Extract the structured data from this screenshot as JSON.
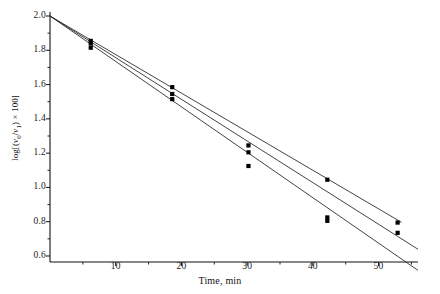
{
  "figure": {
    "background": "#ffffff",
    "ink": "#111111",
    "line_color": "#222222",
    "marker_color": "#000000"
  },
  "axes": {
    "x": {
      "label": "Time, min",
      "ticks": [
        10,
        20,
        30,
        40,
        50
      ],
      "tick_labels": [
        "10",
        "20",
        "30",
        "40",
        "50"
      ],
      "minor_ticks": [
        5,
        15,
        25,
        35,
        45,
        55
      ],
      "range": [
        0,
        56
      ]
    },
    "y": {
      "label_plain": "log[(v0/v1) × 100]",
      "label_parts": {
        "pre": "log[(",
        "v_num": "v",
        "sub_num": "0",
        "slash": "/",
        "v_den": "v",
        "sub_den": "1",
        "post": ") × 100]"
      },
      "ticks": [
        0.6,
        0.8,
        1.0,
        1.2,
        1.4,
        1.6,
        1.8,
        2.0
      ],
      "tick_labels": [
        "0.6",
        "0.8",
        "1.0",
        "1.2",
        "1.4",
        "1.6",
        "1.8",
        "2.0"
      ],
      "minor_ticks": [
        0.7,
        0.9,
        1.1,
        1.3,
        1.5,
        1.7,
        1.9
      ],
      "range": [
        0.52,
        2.05
      ]
    }
  },
  "chart_data": {
    "type": "scatter",
    "title": "",
    "subtitle": "",
    "xlabel": "Time, min",
    "ylabel": "log[(v0/v1) × 100]",
    "xlim": [
      0,
      56
    ],
    "ylim": [
      0.52,
      2.05
    ],
    "grid": false,
    "legend": false,
    "legend_position": "none",
    "marker": "filled-square",
    "annotations": [
      "All three fitted lines converge at the intercept (0, 2.00)."
    ],
    "series": [
      {
        "name": "Run 1 (slowest decay)",
        "fit_line": {
          "intercept": 2.0,
          "slope": -0.0225,
          "x_start": 0,
          "x_end": 53.5
        },
        "points": [
          {
            "x": 6.2,
            "y": 1.855
          },
          {
            "x": 18.6,
            "y": 1.585
          },
          {
            "x": 30.2,
            "y": 1.245
          },
          {
            "x": 42.2,
            "y": 1.045
          },
          {
            "x": 52.9,
            "y": 0.795
          }
        ]
      },
      {
        "name": "Run 2 (intermediate decay)",
        "fit_line": {
          "intercept": 2.0,
          "slope": -0.0243,
          "x_start": 0,
          "x_end": 56.0
        },
        "points": [
          {
            "x": 6.2,
            "y": 1.84
          },
          {
            "x": 18.6,
            "y": 1.545
          },
          {
            "x": 30.2,
            "y": 1.205
          },
          {
            "x": 42.2,
            "y": 0.825
          },
          {
            "x": 52.9,
            "y": 0.735
          }
        ]
      },
      {
        "name": "Run 3 (fastest decay)",
        "fit_line": {
          "intercept": 2.0,
          "slope": -0.0265,
          "x_start": 0,
          "x_end": 56.0
        },
        "points": [
          {
            "x": 6.2,
            "y": 1.815
          },
          {
            "x": 18.6,
            "y": 1.515
          },
          {
            "x": 30.2,
            "y": 1.125
          },
          {
            "x": 42.2,
            "y": 0.805
          }
        ]
      }
    ]
  }
}
